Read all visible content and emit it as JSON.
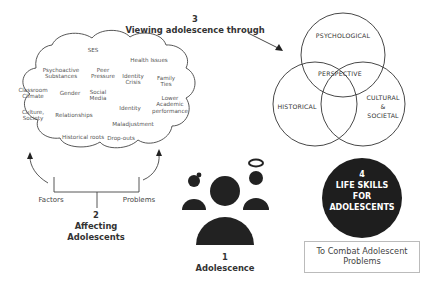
{
  "cloud": {
    "terms": [
      {
        "id": "ses",
        "text": "SES",
        "x": 93,
        "y": 47
      },
      {
        "id": "health",
        "text": "Health Issues",
        "x": 149,
        "y": 57
      },
      {
        "id": "psychoactive",
        "text": "Psychoactive\nSubstances",
        "x": 61,
        "y": 67
      },
      {
        "id": "peer",
        "text": "Peer\nPressure",
        "x": 103,
        "y": 67
      },
      {
        "id": "identity-crisis",
        "text": "Identity\nCrisis",
        "x": 133,
        "y": 73
      },
      {
        "id": "family",
        "text": "Family\nTies",
        "x": 166,
        "y": 75
      },
      {
        "id": "classroom",
        "text": "Classroom\nClimate",
        "x": 33,
        "y": 87
      },
      {
        "id": "gender",
        "text": "Gender",
        "x": 70,
        "y": 90
      },
      {
        "id": "social-media",
        "text": "Social\nMedia",
        "x": 98,
        "y": 89
      },
      {
        "id": "lower-academic",
        "text": "Lower\nAcademic\nperformance",
        "x": 170,
        "y": 95
      },
      {
        "id": "identity",
        "text": "Identity",
        "x": 130,
        "y": 105
      },
      {
        "id": "culture",
        "text": "Culture,\nSociety",
        "x": 33,
        "y": 109
      },
      {
        "id": "relationships",
        "text": "Relationships",
        "x": 74,
        "y": 112
      },
      {
        "id": "maladjustment",
        "text": "Maladjustment",
        "x": 133,
        "y": 121
      },
      {
        "id": "historical-roots",
        "text": "Historical roots",
        "x": 83,
        "y": 134
      },
      {
        "id": "dropouts",
        "text": "Drop-outs",
        "x": 121,
        "y": 135
      }
    ]
  },
  "section3": {
    "number": "3",
    "title": "Viewing adolescence through"
  },
  "section2": {
    "number": "2",
    "title_line1": "Affecting",
    "title_line2": "Adolescents",
    "left_label": "Factors",
    "right_label": "Problems"
  },
  "section1": {
    "number": "1",
    "title": "Adolescence"
  },
  "venn": {
    "top": "PSYCHOLOGICAL",
    "center": "PERSPECTIVE",
    "left": "HISTORICAL",
    "right_line1": "CULTURAL",
    "right_line2": "&",
    "right_line3": "SOCIETAL"
  },
  "section4": {
    "number": "4",
    "line1": "LIFE SKILLS",
    "line2": "FOR",
    "line3": "ADOLESCENTS",
    "caption": "To Combat Adolescent Problems"
  },
  "colors": {
    "ink": "#222222",
    "line": "#333333",
    "box_border": "#bbbbbb",
    "text_light": "#555555"
  }
}
